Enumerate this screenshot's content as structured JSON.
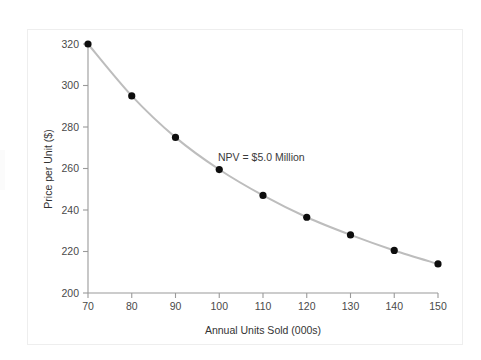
{
  "chart_data": {
    "type": "line",
    "title": "",
    "subtitle": "",
    "xlabel": "Annual Units Sold (000s)",
    "ylabel": "Price per Unit ($)",
    "xlim": [
      70,
      150
    ],
    "ylim": [
      200,
      320
    ],
    "xticks": [
      70,
      80,
      90,
      100,
      110,
      120,
      130,
      140,
      150
    ],
    "yticks": [
      200,
      220,
      240,
      260,
      280,
      300,
      320
    ],
    "xtick_labels": [
      "70",
      "80",
      "90",
      "100",
      "110",
      "120",
      "130",
      "140",
      "150"
    ],
    "ytick_labels": [
      "200",
      "220",
      "240",
      "260",
      "280",
      "300",
      "320"
    ],
    "grid": false,
    "legend": null,
    "legend_position": "none",
    "annotations": [
      {
        "text": "NPV = $5.0 Million",
        "x": 110,
        "y": 265
      }
    ],
    "series": [
      {
        "name": "NPV = $5.0 Million indifference curve",
        "line_color": "#bdbdbd",
        "marker_color": "#0d0d0d",
        "x": [
          70,
          80,
          90,
          100,
          110,
          120,
          130,
          140,
          150
        ],
        "values": [
          320.0,
          295.0,
          275.0,
          259.5,
          247.0,
          236.5,
          228.0,
          220.5,
          214.0
        ]
      }
    ]
  },
  "figure": {
    "frame_color": "#eeeeee",
    "background_color": "#ffffff",
    "axis_color": "#9a9a9a",
    "text_color": "#3a3a3a"
  }
}
